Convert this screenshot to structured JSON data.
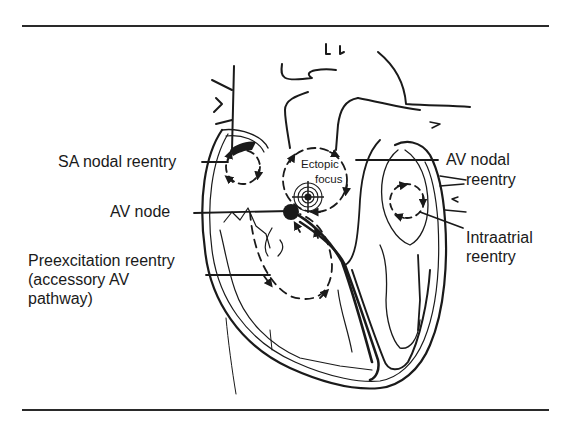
{
  "figure": {
    "type": "heart-cross-section diagram",
    "rule_color": "#2a2a2a",
    "ink_color": "#1a1a1a"
  },
  "labels": {
    "sa_nodal_reentry": "SA nodal reentry",
    "av_node": "AV node",
    "preexcitation_line1": "Preexcitation reentry",
    "preexcitation_line2": "(accessory AV",
    "preexcitation_line3": "pathway)",
    "ectopic_line1": "Ectopic",
    "ectopic_line2": "focus",
    "av_nodal_line1": "AV nodal",
    "av_nodal_line2": "reentry",
    "intraatrial_line1": "Intraatrial",
    "intraatrial_line2": "reentry"
  },
  "structures": [
    {
      "name": "sa-node",
      "shape": "filled crescent",
      "location": "top of right atrium"
    },
    {
      "name": "sa-reentry-circuit",
      "shape": "dashed circle with arrows",
      "location": "right atrium"
    },
    {
      "name": "ectopic-focus",
      "shape": "concentric circles with crosshair",
      "location": "interatrial region"
    },
    {
      "name": "ectopic-reentry-circuit",
      "shape": "dashed circle with arrows",
      "location": "surrounding ectopic focus"
    },
    {
      "name": "av-node",
      "shape": "filled circle",
      "location": "atrioventricular junction"
    },
    {
      "name": "preexcitation-circuit",
      "shape": "dashed loop with arrows",
      "location": "right ventricle"
    },
    {
      "name": "intraatrial-circuit",
      "shape": "dashed circle with arrows",
      "location": "left atrium"
    }
  ]
}
